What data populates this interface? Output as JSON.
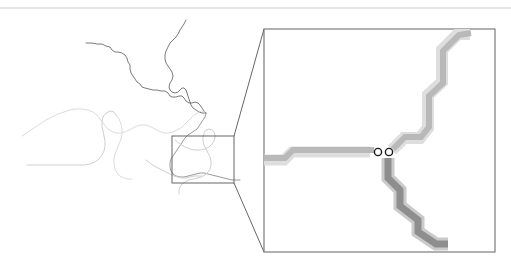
{
  "figure": {
    "name": "stream-network-inset-map",
    "background_color": "#ffffff",
    "top_rule": {
      "color": "#e6e6e6",
      "y": 8,
      "x1": 0,
      "x2": 511,
      "width": 2
    }
  },
  "overview_map": {
    "name": "overview-map",
    "description": "Vector stream network overview, thin meandering polylines",
    "colors": {
      "dark_stream": "#6b6b6b",
      "mid_stream": "#9a9a9a",
      "light_stream": "#cfcfcf",
      "very_light_stream": "#dcdcdc"
    },
    "streams": [
      {
        "id": "stream-upper-left-branch",
        "color": "#6b6b6b",
        "width": 0.9,
        "points": "86,43 92,43 97,44 102,44 106,46 110,47 112,50 115,52 118,52 122,53 125,55 127,58 128,62 130,65 130,69 131,73 133,76 135,79 137,82 140,84 142,87 145,88 149,89 153,90 157,90 161,91 165,91 168,93 170,96 172,97 176,97 179,96 182,96 184,98 186,101 189,103 192,103 195,102 198,103 200,105 202,108 204,111 206,113"
      },
      {
        "id": "stream-upper-right-branch",
        "color": "#6b6b6b",
        "width": 0.9,
        "points": "186,20 184,24 182,27 180,30 178,34 176,37 173,40 170,43 168,47 166,51 165,55 165,59 166,63 168,66 170,69 172,72 173,76 172,80 170,83 169,87 170,90 172,92 175,93 178,92 180,90 182,88 184,88 186,90 187,93 188,96 189,99 190,102 191,105 193,108 196,110 199,112 202,113 206,113"
      },
      {
        "id": "stream-confluence-trunk",
        "color": "#9a9a9a",
        "width": 1.0,
        "points": "206,113 205,117 203,120 201,123 199,126 197,129 194,131 191,133 188,135 185,138 183,141 181,144 179,147 177,150 175,153 173,156 171,159 170,163 170,167 171,171 173,174 176,176 180,177 184,177 188,176 192,175 196,174 200,173 204,173 208,174 212,175 216,176 220,177 224,178 228,179 232,180 236,180 240,180"
      },
      {
        "id": "stream-left-meander-upper",
        "color": "#dcdcdc",
        "width": 1.0,
        "points": "22,136 28,132 34,128 40,124 46,120 52,117 58,114 64,112 70,110 76,109 82,109 88,110 93,112 97,115 100,119 103,123 106,127 109,130 113,132 117,133 121,133 125,132 129,130 133,128 137,126 141,125 145,125 149,126 153,128 157,130 161,132 165,133 169,133 173,132 177,130 181,128 184,125 187,122 190,119 193,116 196,114 199,112 202,111 205,112"
      },
      {
        "id": "stream-left-hook",
        "color": "#cfcfcf",
        "width": 1.0,
        "points": "27,165 40,165 52,165 64,165 76,165 84,165 90,164 95,162 99,159 102,155 104,151 105,146 105,141 104,136 103,131 102,126 102,121 103,117 105,114 108,112 111,111 114,112 116,115"
      },
      {
        "id": "stream-inset-loop",
        "color": "#cfcfcf",
        "width": 1.0,
        "points": "175,140 180,144 185,147 190,149 195,150 200,150 205,149 209,147 212,144 214,141 215,138 215,135 214,132 212,130 209,129 206,130 204,133 203,137 203,141 204,145 206,149 208,153 210,157 211,161 211,165 210,169 208,172 205,175 201,177 197,178 193,179 189,180 185,182 182,184 180,187 179,190 179,194"
      },
      {
        "id": "stream-inset-lower-spur",
        "color": "#cfcfcf",
        "width": 1.0,
        "points": "146,160 150,163 154,166 158,168 162,170 166,172 170,174 174,176 178,177 182,178 186,178 190,177 194,176 198,176 202,176"
      },
      {
        "id": "stream-lower-left-tail",
        "color": "#dcdcdc",
        "width": 1.0,
        "points": "116,115 119,119 121,124 122,129 122,134 121,139 119,144 117,149 115,154 114,159 114,164 115,169 117,173 120,176 124,178 128,179 132,179"
      }
    ],
    "callout_rect": {
      "name": "callout-rectangle",
      "x": 172,
      "y": 136,
      "width": 62,
      "height": 47,
      "stroke": "#555555",
      "stroke_width": 0.9
    },
    "connectors": [
      {
        "id": "connector-upper",
        "x1": 234,
        "y1": 136,
        "x2": 264,
        "y2": 29,
        "stroke": "#555555"
      },
      {
        "id": "connector-lower",
        "x1": 234,
        "y1": 183,
        "x2": 264,
        "y2": 252,
        "stroke": "#555555"
      }
    ]
  },
  "detail_panel": {
    "name": "detail-panel",
    "x": 264,
    "y": 29,
    "width": 231,
    "height": 223,
    "stroke": "#6f6f6f",
    "stroke_width": 1.1,
    "fill": "#ffffff",
    "description": "Zoomed raster view of rasterized stream cells with stair-step pixel geometry",
    "colors": {
      "raster_light_halo": "#dedede",
      "raster_light_core": "#b9b9b9",
      "raster_dark_core": "#8e8e8e",
      "node_stroke": "#1a1a1a",
      "node_fill": "#ffffff"
    },
    "raster_paths": [
      {
        "id": "raster-horizontal-trunk-halo",
        "color": "#dedede",
        "width": 11,
        "points": "264,160 284,160 292,152 370,152"
      },
      {
        "id": "raster-horizontal-trunk-core",
        "color": "#b9b9b9",
        "width": 6,
        "points": "264,158 285,158 293,150 374,150"
      },
      {
        "id": "raster-upper-branch-halo",
        "color": "#dedede",
        "width": 12,
        "points": "392,150 404,138 420,138 428,128 428,95 442,82 442,50 458,34 470,34"
      },
      {
        "id": "raster-upper-branch-core",
        "color": "#b9b9b9",
        "width": 6,
        "points": "393,149 405,137 421,137 429,127 429,96 443,83 443,51 459,35 471,33"
      },
      {
        "id": "raster-lower-branch-halo",
        "color": "#cacaca",
        "width": 13,
        "points": "388,158 388,178 400,190 400,206 418,220 418,232 436,244 448,244"
      },
      {
        "id": "raster-lower-branch-core",
        "color": "#8e8e8e",
        "width": 7,
        "points": "388,158 388,178 400,190 400,206 418,220 418,232 436,244 448,244"
      }
    ],
    "nodes": [
      {
        "id": "node-outlet-left",
        "name": "junction-node-left",
        "cx": 378,
        "cy": 152,
        "r": 3.6
      },
      {
        "id": "node-outlet-right",
        "name": "junction-node-right",
        "cx": 389,
        "cy": 152,
        "r": 3.6
      }
    ]
  }
}
